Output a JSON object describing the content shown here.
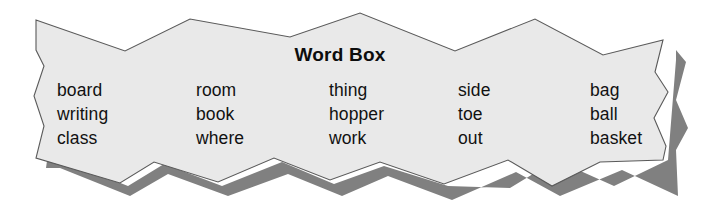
{
  "figure": {
    "name": "word-box-burst",
    "title": "Word Box",
    "shape": "starburst-jagged-banner",
    "fill_color": "#e9e9e9",
    "outline_color": "#5a5a5a",
    "shadow_color": "#808080",
    "background_color": "#ffffff",
    "text_color": "#111111"
  },
  "columns": [
    {
      "words": [
        "board",
        "writing",
        "class"
      ]
    },
    {
      "words": [
        "room",
        "book",
        "where"
      ]
    },
    {
      "words": [
        "thing",
        "hopper",
        "work"
      ]
    },
    {
      "words": [
        "side",
        "toe",
        "out"
      ]
    },
    {
      "words": [
        "bag",
        "ball",
        "basket"
      ]
    }
  ]
}
